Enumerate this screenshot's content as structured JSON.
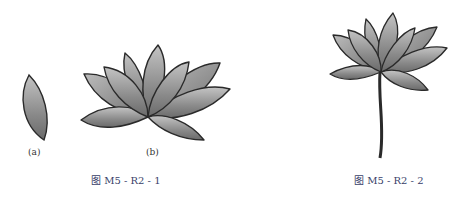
{
  "figure1": {
    "sub_a": "(a)",
    "sub_b": "(b)",
    "caption": "图 M5 - R2 - 1"
  },
  "figure2": {
    "caption": "图 M5 - R2 - 2"
  },
  "colors": {
    "petal_light": "#bdbdbd",
    "petal_dark": "#6e6e6e",
    "outline": "#2a2a2a",
    "caption": "#3a3f6a"
  }
}
